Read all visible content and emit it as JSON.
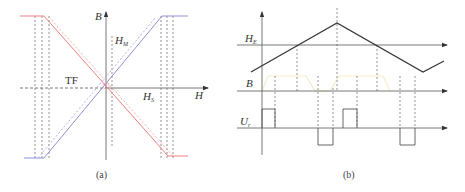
{
  "panel_a": {
    "caption": "(a)",
    "axis_y_label": "B",
    "axis_x_label": "H",
    "label_hm": "H",
    "label_hm_sub": "M",
    "label_hs": "H",
    "label_hs_sub": "S",
    "label_tf": "TF",
    "colors": {
      "red_curve": "#f08080",
      "blue_curve": "#9090d8",
      "axis": "#555555",
      "dashed": "#666666"
    }
  },
  "panel_b": {
    "caption": "(b)",
    "label_he": "H",
    "label_he_sub": "E",
    "label_b": "B",
    "label_ur": "U",
    "label_ur_sub": "r",
    "colors": {
      "triangle": "#333333",
      "b_wave": "#f3edc8",
      "pulse": "#555555",
      "axis": "#555555",
      "dashed": "#666666"
    }
  }
}
